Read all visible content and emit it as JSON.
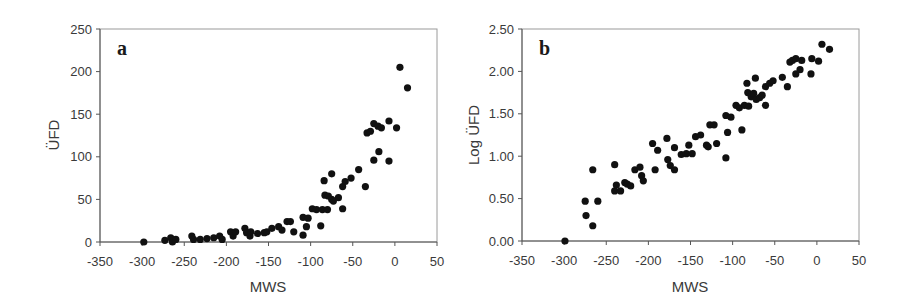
{
  "chart_data": [
    {
      "type": "scatter",
      "panel_label": "a",
      "title": "",
      "xlabel": "MWS",
      "ylabel": "ÜFD",
      "xlim": [
        -350,
        50
      ],
      "ylim": [
        0,
        250
      ],
      "xticks": [
        -350,
        -300,
        -250,
        -200,
        -150,
        -100,
        -50,
        0,
        50
      ],
      "xtick_labels": [
        "-350",
        "-300",
        "-250",
        "-200",
        "-150",
        "-100",
        "-50",
        "0",
        "50"
      ],
      "yticks": [
        0,
        50,
        100,
        150,
        200,
        250
      ],
      "ytick_labels": [
        "0",
        "50",
        "100",
        "150",
        "200",
        "250"
      ],
      "grid": false,
      "legend": null,
      "series": [
        {
          "name": "ÜFD vs MWS",
          "x": [
            -298,
            -273,
            -266,
            -264,
            -260,
            -241,
            -239,
            -231,
            -223,
            -215,
            -208,
            -205,
            -195,
            -192,
            -189,
            -178,
            -176,
            -172,
            -171,
            -163,
            -155,
            -152,
            -146,
            -138,
            -134,
            -128,
            -124,
            -120,
            -109,
            -109,
            -105,
            -103,
            -98,
            -93,
            -88,
            -86,
            -84,
            -83,
            -80,
            -79,
            -75,
            -75,
            -73,
            -67,
            -62,
            -62,
            -59,
            -52,
            -43,
            -35,
            -33,
            -29,
            -25,
            -25,
            -20,
            -19,
            -16,
            -7,
            -7,
            2,
            6,
            15
          ],
          "y": [
            0,
            2,
            5,
            0,
            3,
            7,
            3,
            3,
            4,
            5,
            7,
            3,
            12,
            7,
            12,
            16,
            11,
            7,
            12,
            10,
            11,
            12,
            16,
            18,
            14,
            24,
            24,
            12,
            8,
            29,
            18,
            28,
            39,
            38,
            19,
            38,
            72,
            55,
            38,
            54,
            80,
            50,
            48,
            52,
            39,
            65,
            71,
            75,
            85,
            65,
            128,
            130,
            139,
            96,
            136,
            106,
            134,
            95,
            142,
            134,
            205,
            181
          ]
        }
      ]
    },
    {
      "type": "scatter",
      "panel_label": "b",
      "title": "",
      "xlabel": "MWS",
      "ylabel": "Log ÜFD",
      "xlim": [
        -350,
        50
      ],
      "ylim": [
        0,
        2.5
      ],
      "xticks": [
        -350,
        -300,
        -250,
        -200,
        -150,
        -100,
        -50,
        0,
        50
      ],
      "xtick_labels": [
        "-350",
        "-300",
        "-250",
        "-200",
        "-150",
        "-100",
        "-50",
        "0",
        "50"
      ],
      "yticks": [
        0,
        0.5,
        1,
        1.5,
        2,
        2.5
      ],
      "ytick_labels": [
        "0.00",
        "0.50",
        "1.00",
        "1.50",
        "2.00",
        "2.50"
      ],
      "grid": false,
      "legend": null,
      "series": [
        {
          "name": "Log ÜFD vs MWS",
          "x": [
            -299,
            -275,
            -274,
            -266,
            -266,
            -260,
            -240,
            -240,
            -238,
            -233,
            -228,
            -225,
            -221,
            -216,
            -210,
            -208,
            -206,
            -195,
            -192,
            -189,
            -178,
            -177,
            -174,
            -169,
            -169,
            -161,
            -155,
            -152,
            -148,
            -144,
            -138,
            -131,
            -129,
            -127,
            -122,
            -119,
            -108,
            -108,
            -106,
            -102,
            -96,
            -92,
            -89,
            -86,
            -83,
            -82,
            -81,
            -78,
            -75,
            -73,
            -72,
            -68,
            -65,
            -61,
            -61,
            -56,
            -52,
            -41,
            -35,
            -32,
            -29,
            -25,
            -25,
            -20,
            -18,
            -7,
            -6,
            2,
            6,
            15
          ],
          "y": [
            0.0,
            0.47,
            0.3,
            0.84,
            0.18,
            0.47,
            0.9,
            0.59,
            0.66,
            0.59,
            0.69,
            0.67,
            0.65,
            0.84,
            0.87,
            0.77,
            0.71,
            1.15,
            0.84,
            1.07,
            1.21,
            0.96,
            0.89,
            0.84,
            1.1,
            1.02,
            1.03,
            1.13,
            1.03,
            1.23,
            1.25,
            1.13,
            1.11,
            1.37,
            1.37,
            1.15,
            0.98,
            1.48,
            1.28,
            1.46,
            1.6,
            1.57,
            1.31,
            1.6,
            1.86,
            1.75,
            1.59,
            1.7,
            1.74,
            1.92,
            1.67,
            1.69,
            1.72,
            1.6,
            1.82,
            1.86,
            1.89,
            1.93,
            1.82,
            2.11,
            2.13,
            2.15,
            1.97,
            2.02,
            2.13,
            1.97,
            2.15,
            2.12,
            2.32,
            2.26
          ]
        }
      ]
    }
  ]
}
